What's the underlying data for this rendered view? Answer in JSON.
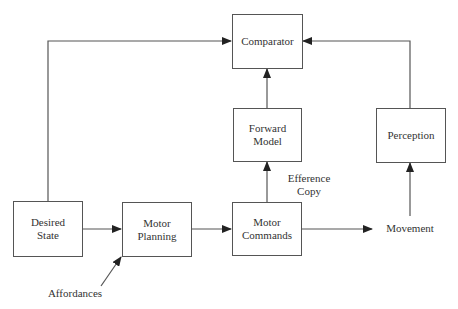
{
  "diagram": {
    "type": "block-diagram",
    "nodes": {
      "comparator": {
        "label": "Comparator"
      },
      "forward_model": {
        "label": "Forward\nModel"
      },
      "perception": {
        "label": "Perception"
      },
      "desired_state": {
        "label": "Desired\nState"
      },
      "motor_planning": {
        "label": "Motor\nPlanning"
      },
      "motor_commands": {
        "label": "Motor\nCommands"
      }
    },
    "labels": {
      "efference_copy": "Efference\nCopy",
      "movement": "Movement",
      "affordances": "Affordances"
    },
    "edges": [
      {
        "from": "Desired State",
        "to": "Comparator"
      },
      {
        "from": "Desired State",
        "to": "Motor Planning"
      },
      {
        "from": "Affordances",
        "to": "Motor Planning"
      },
      {
        "from": "Motor Planning",
        "to": "Motor Commands"
      },
      {
        "from": "Motor Commands",
        "to": "Forward Model",
        "label": "Efference Copy"
      },
      {
        "from": "Forward Model",
        "to": "Comparator"
      },
      {
        "from": "Motor Commands",
        "to": "Movement"
      },
      {
        "from": "Movement",
        "to": "Perception"
      },
      {
        "from": "Perception",
        "to": "Comparator"
      }
    ],
    "colors": {
      "line": "#555555",
      "text": "#333333",
      "background": "#ffffff"
    }
  }
}
